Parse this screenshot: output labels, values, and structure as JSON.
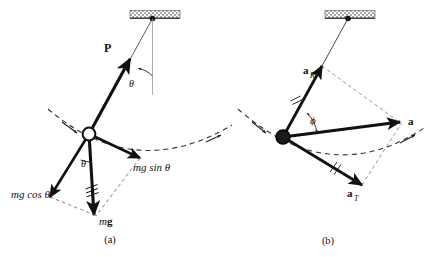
{
  "figure": {
    "background_color": "#ffffff",
    "stroke_color": "#111111",
    "dashed_color": "#444444",
    "ceiling_fill": "#b3b3b3",
    "bob_fill_a": "#ffffff",
    "bob_fill_b": "#1a1a1a"
  },
  "panel_a": {
    "caption": "(a)",
    "labels": {
      "tension": "P",
      "angle_top": "θ",
      "angle_bob": "θ",
      "weight": "m",
      "weight_bold": "g",
      "tangential_component": "mg sin θ",
      "radial_component": "mg cos θ"
    }
  },
  "panel_b": {
    "caption": "(b)",
    "labels": {
      "radial_accel": "a",
      "radial_accel_sub": "R",
      "tangential_accel": "a",
      "tangential_accel_sub": "T",
      "resultant_accel": "a",
      "angle": "ϕ"
    }
  }
}
